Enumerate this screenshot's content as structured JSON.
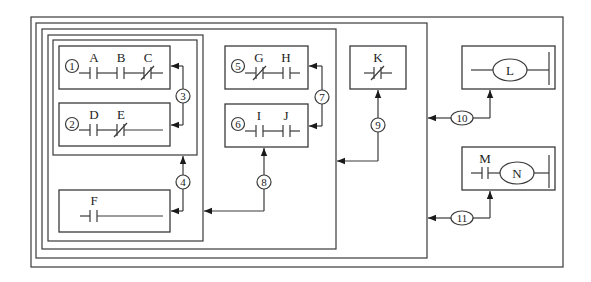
{
  "diagram": {
    "type": "ladder-logic-block-nesting",
    "nested_frames": 5,
    "rungs": [
      {
        "id": "1",
        "contacts": [
          {
            "label": "A",
            "type": "NO"
          },
          {
            "label": "B",
            "type": "NO"
          },
          {
            "label": "C",
            "type": "NC"
          }
        ]
      },
      {
        "id": "2",
        "contacts": [
          {
            "label": "D",
            "type": "NO"
          },
          {
            "label": "E",
            "type": "NC"
          }
        ]
      },
      {
        "id": "F",
        "contacts": [
          {
            "label": "F",
            "type": "NO"
          }
        ]
      },
      {
        "id": "5",
        "contacts": [
          {
            "label": "G",
            "type": "NC"
          },
          {
            "label": "H",
            "type": "NO"
          }
        ]
      },
      {
        "id": "6",
        "contacts": [
          {
            "label": "I",
            "type": "NO"
          },
          {
            "label": "J",
            "type": "NO"
          }
        ]
      },
      {
        "id": "K",
        "contacts": [
          {
            "label": "K",
            "type": "NC"
          }
        ]
      },
      {
        "id": "L",
        "coil": "L"
      },
      {
        "id": "N",
        "contacts": [
          {
            "label": "M",
            "type": "NO"
          }
        ],
        "coil": "N"
      }
    ],
    "labels": {
      "n1": "1",
      "n2": "2",
      "n3": "3",
      "n4": "4",
      "n5": "5",
      "n6": "6",
      "n7": "7",
      "n8": "8",
      "n9": "9",
      "n10": "10",
      "n11": "11",
      "A": "A",
      "B": "B",
      "C": "C",
      "D": "D",
      "E": "E",
      "F": "F",
      "G": "G",
      "H": "H",
      "I": "I",
      "J": "J",
      "K": "K",
      "L": "L",
      "M": "M",
      "N": "N"
    },
    "connections": [
      {
        "step": "3",
        "combines": [
          "1",
          "2"
        ],
        "mode": "parallel"
      },
      {
        "step": "4",
        "combines": [
          "3",
          "F"
        ],
        "mode": "series"
      },
      {
        "step": "7",
        "combines": [
          "5",
          "6"
        ],
        "mode": "parallel"
      },
      {
        "step": "8",
        "combines": [
          "4",
          "7"
        ],
        "mode": "series"
      },
      {
        "step": "9",
        "combines": [
          "8",
          "K"
        ],
        "mode": "series"
      },
      {
        "step": "10",
        "combines": [
          "9",
          "L"
        ],
        "mode": "parallel"
      },
      {
        "step": "11",
        "combines": [
          "10",
          "N"
        ],
        "mode": "parallel"
      }
    ]
  }
}
